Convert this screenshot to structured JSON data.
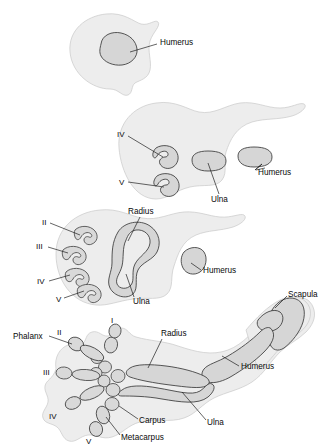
{
  "figure": {
    "colors": {
      "limb_bud_fill": "#ededed",
      "limb_bud_outline": "#c9c9c9",
      "cartilage_fill": "#d6d6d6",
      "cartilage_outline": "#3a3a3a",
      "label_text": "#0a0a0a",
      "background": "#ffffff"
    }
  },
  "stages": [
    {
      "id": "stage-1",
      "labels": [
        {
          "name": "humerus",
          "text": "Humerus",
          "x": 160,
          "y": 42,
          "anchor": "start"
        }
      ],
      "digit_numerals": []
    },
    {
      "id": "stage-2",
      "labels": [
        {
          "name": "humerus",
          "text": "Humerus",
          "x": 258,
          "y": 172,
          "anchor": "start"
        },
        {
          "name": "ulna",
          "text": "Ulna",
          "x": 211,
          "y": 198,
          "anchor": "start"
        }
      ],
      "digit_numerals": [
        {
          "text": "IV",
          "x": 117,
          "y": 134
        },
        {
          "text": "V",
          "x": 119,
          "y": 182
        }
      ]
    },
    {
      "id": "stage-3",
      "labels": [
        {
          "name": "radius",
          "text": "Radius",
          "x": 128,
          "y": 211,
          "anchor": "start"
        },
        {
          "name": "humerus",
          "text": "Humerus",
          "x": 203,
          "y": 270,
          "anchor": "start"
        },
        {
          "name": "ulna",
          "text": "Ulna",
          "x": 133,
          "y": 301,
          "anchor": "start"
        }
      ],
      "digit_numerals": [
        {
          "text": "II",
          "x": 42,
          "y": 222
        },
        {
          "text": "III",
          "x": 36,
          "y": 246
        },
        {
          "text": "IV",
          "x": 37,
          "y": 281
        },
        {
          "text": "V",
          "x": 56,
          "y": 299
        }
      ]
    },
    {
      "id": "stage-4",
      "labels": [
        {
          "name": "scapula",
          "text": "Scapula",
          "x": 288,
          "y": 294,
          "anchor": "start"
        },
        {
          "name": "phalanx",
          "text": "Phalanx",
          "x": 13,
          "y": 336,
          "anchor": "start"
        },
        {
          "name": "radius",
          "text": "Radius",
          "x": 161,
          "y": 333,
          "anchor": "start"
        },
        {
          "name": "humerus",
          "text": "Humerus",
          "x": 241,
          "y": 366,
          "anchor": "start"
        },
        {
          "name": "carpus",
          "text": "Carpus",
          "x": 139,
          "y": 420,
          "anchor": "start"
        },
        {
          "name": "ulna",
          "text": "Ulna",
          "x": 207,
          "y": 422,
          "anchor": "start"
        },
        {
          "name": "metacarpus",
          "text": "Metacarpus",
          "x": 121,
          "y": 437,
          "anchor": "start"
        }
      ],
      "digit_numerals": [
        {
          "text": "I",
          "x": 111,
          "y": 320
        },
        {
          "text": "II",
          "x": 57,
          "y": 332
        },
        {
          "text": "III",
          "x": 43,
          "y": 372
        },
        {
          "text": "IV",
          "x": 49,
          "y": 416
        },
        {
          "text": "V",
          "x": 86,
          "y": 441
        }
      ]
    }
  ]
}
